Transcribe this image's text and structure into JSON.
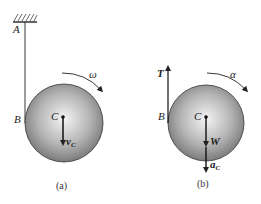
{
  "figure_a": {
    "caption": "(a)",
    "labels": {
      "support_point": "A",
      "contact_point": "B",
      "center": "C",
      "angular_velocity": "ω",
      "velocity": "v",
      "velocity_sub": "C"
    }
  },
  "figure_b": {
    "caption": "(b)",
    "labels": {
      "tension": "T",
      "contact_point": "B",
      "center": "C",
      "angular_acceleration": "α",
      "weight": "W",
      "acceleration": "a",
      "acceleration_sub": "C"
    }
  },
  "colors": {
    "disk_light": "#f4f4f4",
    "disk_dark": "#6e6e6e",
    "line": "#222222"
  }
}
